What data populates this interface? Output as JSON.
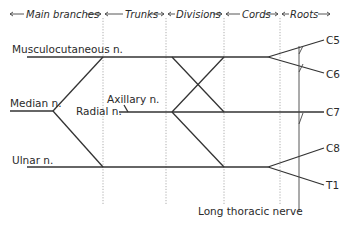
{
  "header": {
    "sections": [
      {
        "label": "Main branches"
      },
      {
        "label": "Trunks"
      },
      {
        "label": "Divisions"
      },
      {
        "label": "Cords"
      },
      {
        "label": "Roots"
      }
    ]
  },
  "nerves": {
    "musculocutaneous": "Musculocutaneous n.",
    "median": "Median n.",
    "axillary": "Axillary n.",
    "radial": "Radial n.",
    "ulnar": "Ulnar n.",
    "long_thoracic": "Long thoracic nerve"
  },
  "roots": [
    "C5",
    "C6",
    "C7",
    "C8",
    "T1"
  ],
  "colors": {
    "line": "#333333",
    "divider": "#999999",
    "text": "#2a2a2a",
    "background": "#ffffff"
  }
}
